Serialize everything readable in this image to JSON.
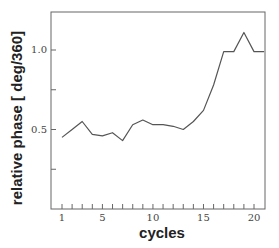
{
  "chart_data": {
    "type": "line",
    "title": "",
    "xlabel": "cycles",
    "ylabel": "relative phase [ deg/360]",
    "x": [
      1,
      2,
      3,
      4,
      5,
      6,
      7,
      8,
      9,
      10,
      11,
      12,
      13,
      14,
      15,
      16,
      17,
      18,
      19,
      20,
      21
    ],
    "series": [
      {
        "name": "relative phase",
        "values": [
          0.45,
          0.5,
          0.55,
          0.47,
          0.46,
          0.48,
          0.43,
          0.53,
          0.56,
          0.53,
          0.53,
          0.52,
          0.5,
          0.55,
          0.62,
          0.78,
          0.99,
          0.99,
          1.11,
          0.99,
          0.99
        ]
      }
    ],
    "xlim": [
      0,
      21
    ],
    "ylim": [
      0,
      1.25
    ],
    "x_ticks_labeled": [
      1,
      5,
      10,
      15,
      20
    ],
    "x_tick_labels": [
      "1",
      "5",
      "10",
      "15",
      "20"
    ],
    "x_minor_ticks": [
      1,
      2,
      3,
      4,
      5,
      6,
      7,
      8,
      9,
      10,
      11,
      12,
      13,
      14,
      15,
      16,
      17,
      18,
      19,
      20
    ],
    "y_ticks": [
      0.25,
      0.5,
      0.75,
      1.0
    ],
    "y_tick_labels": [
      "",
      "0.5",
      "",
      "1.0"
    ],
    "grid": false,
    "legend": "none",
    "line_color": "#555555"
  }
}
